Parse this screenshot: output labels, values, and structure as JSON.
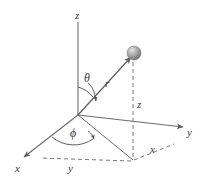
{
  "figure": {
    "name": "spherical-coordinate-system-diagram",
    "background_color": "#ffffff",
    "line_color": "#6b6b6b",
    "sphere_color": "#9a9a9a"
  },
  "labels": {
    "z_axis": "z",
    "y_axis": "y",
    "x_axis": "x",
    "radius": "r",
    "polar_angle": "θ",
    "azimuthal_angle": "ϕ",
    "height_component": "z",
    "y_component": "y",
    "x_component": "x"
  },
  "geometry": {
    "origin": [
      78,
      115
    ],
    "z_axis_tip": [
      78,
      22
    ],
    "y_axis_tip": [
      186,
      127
    ],
    "x_axis_tip": [
      22,
      158
    ],
    "particle": [
      133,
      53
    ],
    "projection_point": [
      133,
      160
    ],
    "x_foot": [
      170,
      142
    ],
    "y_foot": [
      42,
      158
    ]
  }
}
